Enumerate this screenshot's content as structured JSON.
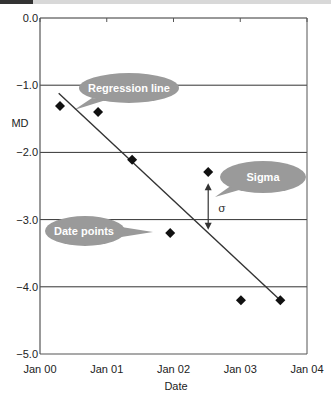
{
  "chart_data": {
    "type": "scatter",
    "title": "",
    "xlabel": "Date",
    "ylabel": "MD",
    "xlim": [
      0,
      4
    ],
    "ylim": [
      -5.0,
      0.0
    ],
    "grid": "horizontal",
    "x_ticks": [
      {
        "value": 0,
        "label": "Jan 00"
      },
      {
        "value": 1,
        "label": "Jan 01"
      },
      {
        "value": 2,
        "label": "Jan 02"
      },
      {
        "value": 3,
        "label": "Jan 03"
      },
      {
        "value": 4,
        "label": "Jan 04"
      }
    ],
    "y_ticks": [
      {
        "value": 0.0,
        "label": "0.0"
      },
      {
        "value": -1.0,
        "label": "−1.0"
      },
      {
        "value": -2.0,
        "label": "−2.0"
      },
      {
        "value": -3.0,
        "label": "−3.0"
      },
      {
        "value": -4.0,
        "label": "−4.0"
      },
      {
        "value": -5.0,
        "label": "−5.0"
      }
    ],
    "series": [
      {
        "name": "Date points",
        "marker": "diamond",
        "color": "#111111",
        "points": [
          {
            "x": 0.3,
            "y": -1.31
          },
          {
            "x": 0.87,
            "y": -1.4
          },
          {
            "x": 1.38,
            "y": -2.11
          },
          {
            "x": 1.95,
            "y": -3.2
          },
          {
            "x": 2.52,
            "y": -2.29
          },
          {
            "x": 3.01,
            "y": -4.2
          },
          {
            "x": 3.6,
            "y": -4.2
          }
        ]
      },
      {
        "name": "Regression line",
        "type": "line",
        "color": "#333333",
        "points": [
          {
            "x": 0.28,
            "y": -1.12
          },
          {
            "x": 3.6,
            "y": -4.2
          }
        ]
      }
    ],
    "annotations": [
      {
        "type": "callout",
        "text": "Regression line"
      },
      {
        "type": "callout",
        "text": "Sigma"
      },
      {
        "type": "callout",
        "text": "Date points"
      },
      {
        "type": "double-arrow",
        "label": "σ",
        "x": 2.52,
        "y_from": -2.46,
        "y_to": -3.15
      }
    ]
  },
  "colors": {
    "callout_fill": "#9a9a9a",
    "gridline": "#333333",
    "axis": "#555555",
    "marker": "#111111",
    "banner_dark": "#333333",
    "banner_light": "#d8d8d8"
  }
}
